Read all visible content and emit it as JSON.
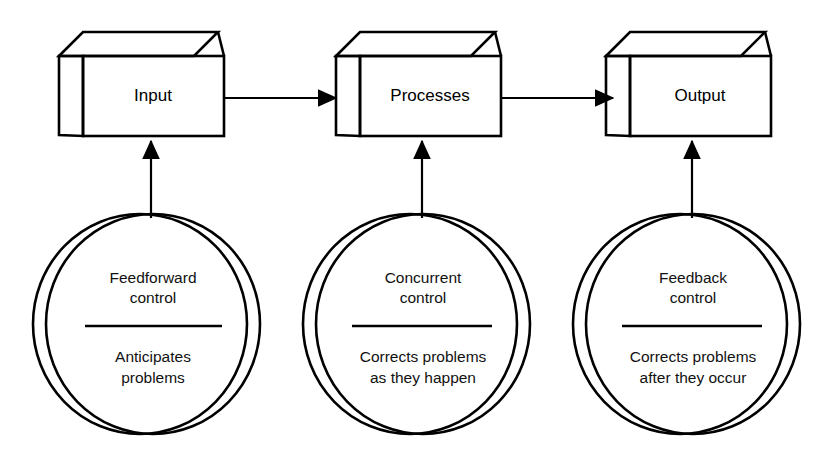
{
  "diagram": {
    "background_color": "#ffffff",
    "palette": {
      "box_front": "#e9e9e9",
      "box_top": "#a9a9a9",
      "box_side": "#bcbcbc",
      "circle_front": "#d9d9d9",
      "circle_back": "#b2b2b2",
      "outline": "#000000",
      "text": "#000000"
    },
    "boxes": [
      {
        "id": "input",
        "label": "Input"
      },
      {
        "id": "processes",
        "label": "Processes"
      },
      {
        "id": "output",
        "label": "Output"
      }
    ],
    "circles": [
      {
        "id": "feedforward",
        "title_lines": [
          "Feedforward",
          "control"
        ],
        "desc_lines": [
          "Anticipates",
          "problems"
        ]
      },
      {
        "id": "concurrent",
        "title_lines": [
          "Concurrent",
          "control"
        ],
        "desc_lines": [
          "Corrects problems",
          "as they happen"
        ]
      },
      {
        "id": "feedback",
        "title_lines": [
          "Feedback",
          "control"
        ],
        "desc_lines": [
          "Corrects problems",
          "after they occur"
        ]
      }
    ],
    "connectors": {
      "horizontal": [
        {
          "id": "input-to-processes",
          "from": "input",
          "to": "processes"
        },
        {
          "id": "processes-to-output",
          "from": "processes",
          "to": "output"
        }
      ],
      "vertical": [
        {
          "id": "feedforward-to-input",
          "from": "feedforward",
          "to": "input"
        },
        {
          "id": "concurrent-to-processes",
          "from": "concurrent",
          "to": "processes"
        },
        {
          "id": "feedback-to-output",
          "from": "feedback",
          "to": "output"
        }
      ]
    }
  }
}
